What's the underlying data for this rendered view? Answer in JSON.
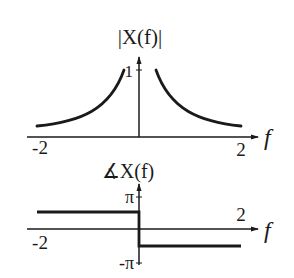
{
  "magnitude_plot": {
    "title": "|X(f)|",
    "y_tick_label": "1",
    "x_axis_label": "f",
    "x_tick_left": "-2",
    "x_tick_right": "2"
  },
  "phase_plot": {
    "title": "∡X(f)",
    "y_tick_top": "π",
    "y_tick_bottom": "-π",
    "x_axis_label": "f",
    "x_tick_left": "-2",
    "x_tick_right": "2"
  },
  "colors": {
    "line": "#1a1a1a",
    "background": "#ffffff"
  }
}
